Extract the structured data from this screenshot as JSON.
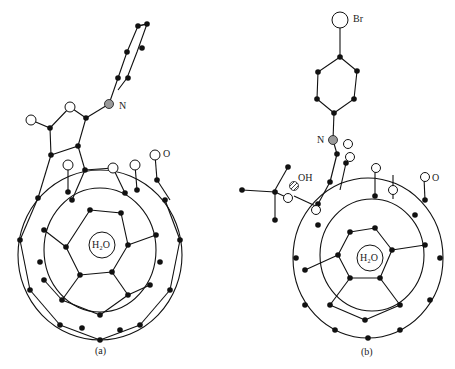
{
  "figure": {
    "panels": [
      {
        "id": "a",
        "caption": "(a)",
        "encapsulated": "H2O",
        "encapsulated_display": "H₂O",
        "atom_labels": [
          "N",
          "O"
        ],
        "description": "Open-cage fullerene with pyrrolidine-fused phenyl substituent, water encapsulated"
      },
      {
        "id": "b",
        "caption": "(b)",
        "encapsulated": "H2O",
        "encapsulated_display": "H₂O",
        "atom_labels": [
          "Br",
          "N",
          "OH",
          "O"
        ],
        "description": "Open-cage fullerene with 4-bromophenyl imine substituent and tert-butyl/hydroxyl group, water encapsulated"
      }
    ],
    "legend": {
      "filled_circle": "carbon",
      "open_circle": "oxygen",
      "grey_circle": "nitrogen",
      "hatched_circle": "hydroxyl oxygen",
      "large_open_circle": "bromine"
    },
    "colors": {
      "bond": "#111111",
      "carbon": "#111111",
      "nitrogen": "#9a9a9a",
      "oxygen": "#ffffff"
    }
  }
}
